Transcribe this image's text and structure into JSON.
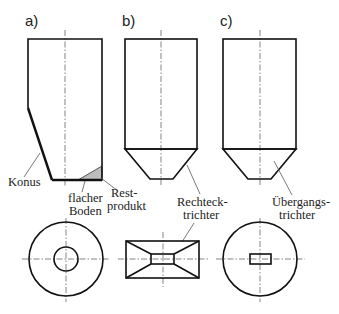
{
  "figure": {
    "panels": [
      {
        "id": "a",
        "label": "a)",
        "side_view": "Silo mit einseitigem Konus und flachem Boden",
        "top_view": "Kreis mit runder Öffnung"
      },
      {
        "id": "b",
        "label": "b)",
        "side_view": "Silo mit Rechtecktrichter",
        "top_view": "Rechteck mit Rechtecköffnung"
      },
      {
        "id": "c",
        "label": "c)",
        "side_view": "Silo mit Übergangstrichter",
        "top_view": "Kreis mit Rechtecköffnung"
      }
    ],
    "annotations": {
      "konus": "Konus",
      "flacher_1": "flacher",
      "flacher_2": "Boden",
      "rest_1": "Rest-",
      "rest_2": "produkt",
      "rechteck_1": "Rechteck-",
      "rechteck_2": "trichter",
      "uebergang_1": "Übergangs-",
      "uebergang_2": "trichter"
    },
    "colors": {
      "outline": "#111111",
      "centerline": "#777777",
      "residue_fill": "#bdbdbd"
    }
  }
}
